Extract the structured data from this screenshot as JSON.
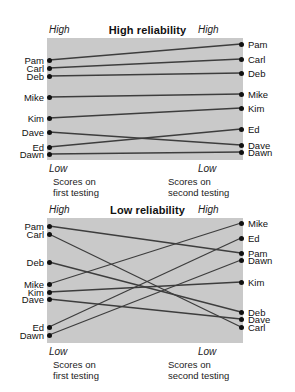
{
  "figure": {
    "background_color": "#ffffff",
    "plot_fill_color": "#c9c9c9",
    "line_color": "#3d3d3d",
    "dot_color": "#111111"
  },
  "panels": [
    {
      "id": "high",
      "title": "High reliability",
      "axis_top_left": "High",
      "axis_top_right": "High",
      "axis_bottom_left": "Low",
      "axis_bottom_right": "Low",
      "footer_left": "Scores on\nfirst testing",
      "footer_right": "Scores on\nsecond testing",
      "left_labels": [
        "Pam",
        "Carl",
        "Deb",
        "Mike",
        "Kim",
        "Dave",
        "Ed",
        "Dawn"
      ],
      "right_labels": [
        "Pam",
        "Carl",
        "Deb",
        "Mike",
        "Kim",
        "Ed",
        "Dave",
        "Dawn"
      ],
      "left_y": [
        60,
        68,
        76,
        97,
        118,
        132,
        147,
        154
      ],
      "right_y": [
        44,
        59,
        73,
        94,
        108,
        129,
        145,
        152
      ],
      "connections": [
        {
          "name": "Pam",
          "from_y": 60,
          "to_y": 44
        },
        {
          "name": "Carl",
          "from_y": 68,
          "to_y": 59
        },
        {
          "name": "Deb",
          "from_y": 76,
          "to_y": 73
        },
        {
          "name": "Mike",
          "from_y": 97,
          "to_y": 94
        },
        {
          "name": "Kim",
          "from_y": 118,
          "to_y": 108
        },
        {
          "name": "Dave",
          "from_y": 132,
          "to_y": 145
        },
        {
          "name": "Ed",
          "from_y": 147,
          "to_y": 129
        },
        {
          "name": "Dawn",
          "from_y": 154,
          "to_y": 152
        }
      ],
      "plot_top": 38,
      "plot_bottom": 160
    },
    {
      "id": "low",
      "title": "Low reliability",
      "axis_top_left": "High",
      "axis_top_right": "High",
      "axis_bottom_left": "Low",
      "axis_bottom_right": "Low",
      "footer_left": "Scores on\nfirst testing",
      "footer_right": "Scores on\nsecond testing",
      "left_labels": [
        "Pam",
        "Carl",
        "Deb",
        "Mike",
        "Kim",
        "Dave",
        "Ed",
        "Dawn"
      ],
      "right_labels": [
        "Mike",
        "Ed",
        "Pam",
        "Dawn",
        "Kim",
        "Deb",
        "Dave",
        "Carl"
      ],
      "left_y": [
        226,
        234,
        262,
        284,
        292,
        299,
        327,
        335
      ],
      "right_y": [
        223,
        238,
        253,
        260,
        282,
        312,
        319,
        327
      ],
      "connections": [
        {
          "name": "Pam",
          "from_y": 226,
          "to_y": 253
        },
        {
          "name": "Carl",
          "from_y": 234,
          "to_y": 327
        },
        {
          "name": "Deb",
          "from_y": 262,
          "to_y": 312
        },
        {
          "name": "Mike",
          "from_y": 284,
          "to_y": 223
        },
        {
          "name": "Kim",
          "from_y": 292,
          "to_y": 282
        },
        {
          "name": "Dave",
          "from_y": 299,
          "to_y": 319
        },
        {
          "name": "Ed",
          "from_y": 327,
          "to_y": 238
        },
        {
          "name": "Dawn",
          "from_y": 335,
          "to_y": 260
        }
      ],
      "plot_top": 218,
      "plot_bottom": 343
    }
  ],
  "chart_data": {
    "type": "line",
    "xlabel": "",
    "ylabel": "Score",
    "x": [
      "Scores on first testing",
      "Scores on second testing"
    ],
    "ylim": [
      "Low",
      "High"
    ],
    "grid": false,
    "legend": "none",
    "charts": [
      {
        "title": "High reliability",
        "series": [
          {
            "name": "Pam",
            "values": [
              7.0,
              8.0
            ]
          },
          {
            "name": "Carl",
            "values": [
              6.5,
              7.0
            ]
          },
          {
            "name": "Deb",
            "values": [
              6.1,
              6.3
            ]
          },
          {
            "name": "Mike",
            "values": [
              5.0,
              5.1
            ]
          },
          {
            "name": "Kim",
            "values": [
              3.9,
              4.4
            ]
          },
          {
            "name": "Dave",
            "values": [
              3.2,
              2.6
            ]
          },
          {
            "name": "Ed",
            "values": [
              2.4,
              3.3
            ]
          },
          {
            "name": "Dawn",
            "values": [
              2.1,
              2.2
            ]
          }
        ]
      },
      {
        "title": "Low reliability",
        "series": [
          {
            "name": "Pam",
            "values": [
              7.5,
              6.2
            ]
          },
          {
            "name": "Carl",
            "values": [
              7.1,
              2.4
            ]
          },
          {
            "name": "Deb",
            "values": [
              5.7,
              3.2
            ]
          },
          {
            "name": "Mike",
            "values": [
              4.6,
              7.7
            ]
          },
          {
            "name": "Kim",
            "values": [
              4.2,
              4.7
            ]
          },
          {
            "name": "Dave",
            "values": [
              3.8,
              2.8
            ]
          },
          {
            "name": "Ed",
            "values": [
              2.4,
              6.9
            ]
          },
          {
            "name": "Dawn",
            "values": [
              2.0,
              5.8
            ]
          }
        ]
      }
    ]
  }
}
